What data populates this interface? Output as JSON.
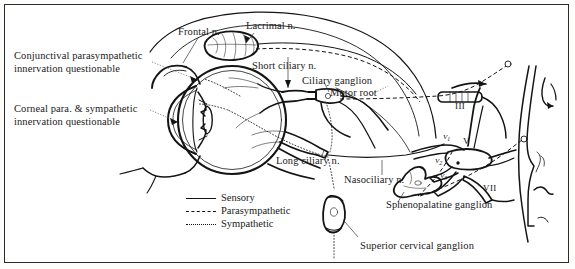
{
  "figure": {
    "frame_color": "#2b2b2b",
    "ink_color": "#141414",
    "background": "#ffffff"
  },
  "labels": {
    "frontal_nerve": "Frontal n.",
    "lacrimal_nerve": "Lacrimal n.",
    "short_ciliary_nerve": "Short ciliary n.",
    "ciliary_ganglion": "Ciliary ganglion",
    "motor_root": "Motor root",
    "long_ciliary_nerve": "Long ciliary n.",
    "nasociliary_nerve": "Nasociliary n.",
    "sphenopalatine_ganglion": "Sphenopalatine ganglion",
    "superior_cervical_ganglion": "Superior cervical ganglion",
    "conjunctival_note_line1": "Conjunctival parasympathetic",
    "conjunctival_note_line2": "innervation questionable",
    "corneal_note_line1": "Corneal para. & sympathetic",
    "corneal_note_line2": "innervation questionable"
  },
  "cranial_nerves": {
    "oculomotor": "III",
    "trigeminal": "V",
    "facial": "VII",
    "ophthalmic_division": "V",
    "ophthalmic_subscript": "1",
    "maxillary_division": "V",
    "maxillary_subscript": "2",
    "mandibular_division": "V",
    "mandibular_subscript": "3"
  },
  "legend": {
    "items": [
      {
        "label": "Sensory",
        "style": "solid",
        "key": "key-solid"
      },
      {
        "label": "Parasympathetic",
        "style": "dashed",
        "key": "key-dashed"
      },
      {
        "label": "Sympathetic",
        "style": "dotted",
        "key": "key-dotted"
      }
    ]
  }
}
